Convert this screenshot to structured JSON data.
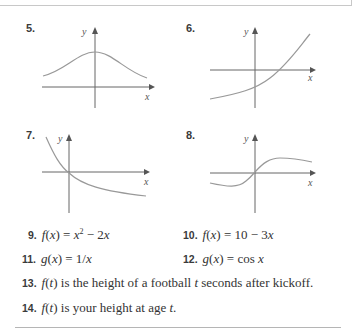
{
  "graphs": [
    {
      "number": "5.",
      "y_label": "y",
      "x_label": "x",
      "description": "bell-shaped curve, maximum on y-axis, above x-axis"
    },
    {
      "number": "6.",
      "y_label": "y",
      "x_label": "x",
      "description": "increasing exponential-like curve crossing y-axis below origin and x-axis to the right"
    },
    {
      "number": "7.",
      "y_label": "y",
      "x_label": "x",
      "description": "decreasing curve passing through origin, leveling off below x-axis"
    },
    {
      "number": "8.",
      "y_label": "y",
      "x_label": "x",
      "description": "S-shaped increasing curve through origin, leveling off above and below"
    }
  ],
  "exercises": [
    {
      "number": "9.",
      "text": "f(x) = x² − 2x"
    },
    {
      "number": "10.",
      "text": "f(x) = 10 − 3x"
    },
    {
      "number": "11.",
      "text": "g(x) = 1/x"
    },
    {
      "number": "12.",
      "text": "g(x) = cos x"
    },
    {
      "number": "13.",
      "text": "f(t) is the height of a football t seconds after kickoff."
    },
    {
      "number": "14.",
      "text": "f(t) is your height at age t."
    }
  ]
}
